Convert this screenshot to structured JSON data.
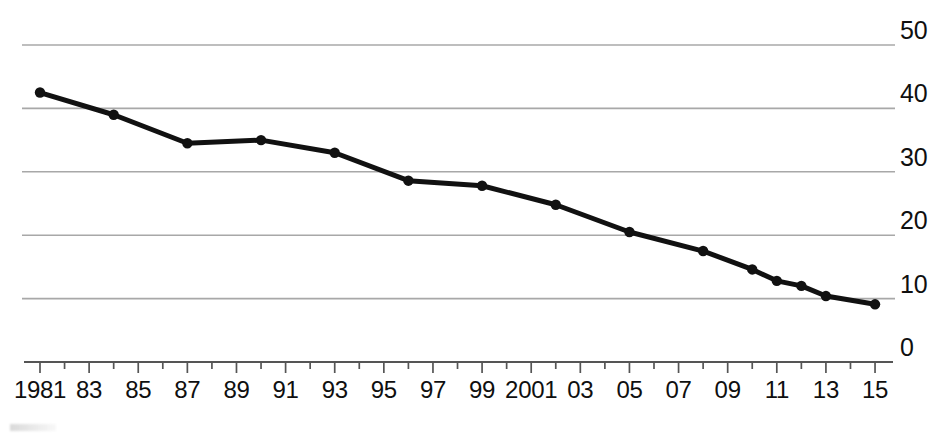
{
  "chart_data": {
    "type": "line",
    "title": "",
    "subtitle": "",
    "xlabel": "",
    "ylabel": "",
    "xlim": [
      1981,
      2016.5
    ],
    "ylim": [
      0,
      50
    ],
    "grid": true,
    "grid_axis": "y",
    "legend": "none",
    "y_ticks": [
      {
        "value": 50,
        "label": "50"
      },
      {
        "value": 40,
        "label": "40"
      },
      {
        "value": 30,
        "label": "30"
      },
      {
        "value": 20,
        "label": "20"
      },
      {
        "value": 10,
        "label": "10"
      },
      {
        "value": 0,
        "label": "0"
      }
    ],
    "x_ticks": [
      {
        "value": 1981,
        "label": "1981"
      },
      {
        "value": 1983,
        "label": "83"
      },
      {
        "value": 1985,
        "label": "85"
      },
      {
        "value": 1987,
        "label": "87"
      },
      {
        "value": 1989,
        "label": "89"
      },
      {
        "value": 1991,
        "label": "91"
      },
      {
        "value": 1993,
        "label": "93"
      },
      {
        "value": 1995,
        "label": "95"
      },
      {
        "value": 1997,
        "label": "97"
      },
      {
        "value": 1999,
        "label": "99"
      },
      {
        "value": 2001,
        "label": "2001"
      },
      {
        "value": 2003,
        "label": "03"
      },
      {
        "value": 2005,
        "label": "05"
      },
      {
        "value": 2007,
        "label": "07"
      },
      {
        "value": 2009,
        "label": "09"
      },
      {
        "value": 2011,
        "label": "11"
      },
      {
        "value": 2013,
        "label": "13"
      },
      {
        "value": 2015,
        "label": "15"
      }
    ],
    "x_minor_ticks": [
      1982,
      1984,
      1986,
      1988,
      1990,
      1992,
      1994,
      1996,
      1998,
      2000,
      2002,
      2004,
      2006,
      2008,
      2010,
      2012,
      2014
    ],
    "series": [
      {
        "name": "series-1",
        "color": "#111111",
        "marker": "circle",
        "x": [
          1981,
          1984,
          1987,
          1990,
          1993,
          1996,
          1999,
          2002,
          2005,
          2008,
          2010,
          2011,
          2012,
          2013,
          2015
        ],
        "values": [
          42.5,
          39.0,
          34.5,
          35.0,
          33.0,
          28.6,
          27.8,
          24.8,
          20.5,
          17.5,
          14.6,
          12.8,
          12.0,
          10.4,
          9.1
        ]
      }
    ],
    "colors": {
      "line": "#111111",
      "marker": "#111111",
      "gridline": "#a8a8a8",
      "axis": "#555555",
      "tick": "#555555",
      "background": "#ffffff",
      "text": "#0f0f0f"
    }
  }
}
